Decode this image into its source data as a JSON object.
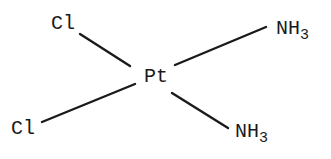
{
  "diagram": {
    "type": "chemical-structure",
    "center": {
      "label": "Pt"
    },
    "ligands": [
      {
        "position": "top-left",
        "label": "Cl"
      },
      {
        "position": "bottom-left",
        "label": "Cl"
      },
      {
        "position": "top-right",
        "label": "NH",
        "subscript": "3"
      },
      {
        "position": "bottom-right",
        "label": "NH",
        "subscript": "3"
      }
    ],
    "bonds": [
      {
        "from": "Pt",
        "to": "top-left Cl"
      },
      {
        "from": "Pt",
        "to": "bottom-left Cl"
      },
      {
        "from": "Pt",
        "to": "top-right NH3"
      },
      {
        "from": "Pt",
        "to": "bottom-right NH3"
      }
    ],
    "colors": {
      "ink": "#1a1a1a",
      "background": "#ffffff"
    }
  }
}
